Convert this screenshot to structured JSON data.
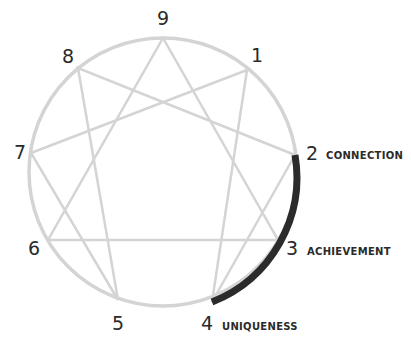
{
  "diagram": {
    "type": "enneagram",
    "colors": {
      "lines": "#d4d4d4",
      "highlight_arc": "#2b2b2b",
      "text": "#2a2a2a"
    },
    "points": [
      {
        "number": "9",
        "label": ""
      },
      {
        "number": "1",
        "label": ""
      },
      {
        "number": "2",
        "label": "CONNECTION"
      },
      {
        "number": "3",
        "label": "ACHIEVEMENT"
      },
      {
        "number": "4",
        "label": "UNIQUENESS"
      },
      {
        "number": "5",
        "label": ""
      },
      {
        "number": "6",
        "label": ""
      },
      {
        "number": "7",
        "label": ""
      },
      {
        "number": "8",
        "label": ""
      }
    ],
    "highlighted_arc": "2 to 4 (heart triad)"
  }
}
